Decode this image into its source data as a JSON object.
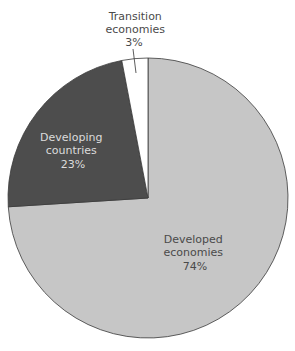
{
  "chart_data": {
    "type": "pie",
    "title": "",
    "start_angle_deg": 0,
    "direction": "clockwise",
    "slices": [
      {
        "name": "Developed economies",
        "label_lines": [
          "Developed",
          "economies"
        ],
        "value": 74,
        "value_label": "74%",
        "color": "#c6c6c6",
        "text_color": "#4a4a4a"
      },
      {
        "name": "Developing countries",
        "label_lines": [
          "Developing",
          "countries"
        ],
        "value": 23,
        "value_label": "23%",
        "color": "#4d4d4d",
        "text_color": "#dcdcdc"
      },
      {
        "name": "Transition economies",
        "label_lines": [
          "Transition",
          "economies"
        ],
        "value": 3,
        "value_label": "3%",
        "color": "#ffffff",
        "text_color": "#4a4a4a"
      }
    ],
    "categories": [
      "Developed economies",
      "Developing countries",
      "Transition economies"
    ],
    "values": [
      74,
      23,
      3
    ],
    "legend": "none (labels on slices)"
  },
  "labels": {
    "developed": {
      "line1": "Developed",
      "line2": "economies",
      "value": "74%"
    },
    "developing": {
      "line1": "Developing",
      "line2": "countries",
      "value": "23%"
    },
    "transition": {
      "line1": "Transition",
      "line2": "economies",
      "value": "3%"
    }
  }
}
